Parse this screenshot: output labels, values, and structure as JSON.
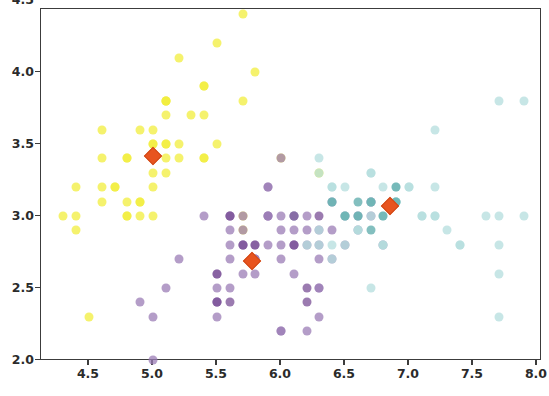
{
  "figure": {
    "title": "",
    "background": "#ffffff",
    "axis_color": "#3c3c3c"
  },
  "axes": {
    "x_ticks": [
      "4.5",
      "5.0",
      "5.5",
      "6.0",
      "6.5",
      "7.0",
      "7.5",
      "8.0"
    ],
    "x_tick_values": [
      4.5,
      5.0,
      5.5,
      6.0,
      6.5,
      7.0,
      7.5,
      8.0
    ],
    "y_ticks": [
      "2.0",
      "2.5",
      "3.0",
      "3.5",
      "4.0",
      "4.5"
    ],
    "y_tick_values": [
      2.0,
      2.5,
      3.0,
      3.5,
      4.0,
      4.5
    ],
    "xlabel": "",
    "ylabel": ""
  },
  "chart_data": {
    "type": "scatter",
    "title": "",
    "xlabel": "",
    "ylabel": "",
    "xlim": [
      4.2,
      8.1
    ],
    "ylim": [
      1.9,
      4.55
    ],
    "grid": false,
    "legend": "none",
    "point_size": 9,
    "point_opacity": 0.75,
    "marker": "circle",
    "centroid_marker": "diamond",
    "centroid_color": "#e8541f",
    "series": [
      {
        "name": "cluster-yellow",
        "color": "#f2ee3c",
        "centroid": [
          5.0,
          3.42
        ],
        "points": [
          [
            5.1,
            3.5
          ],
          [
            4.9,
            3.0
          ],
          [
            4.7,
            3.2
          ],
          [
            4.6,
            3.1
          ],
          [
            5.0,
            3.6
          ],
          [
            5.4,
            3.9
          ],
          [
            4.6,
            3.4
          ],
          [
            5.0,
            3.4
          ],
          [
            4.4,
            2.9
          ],
          [
            4.9,
            3.1
          ],
          [
            5.4,
            3.7
          ],
          [
            4.8,
            3.4
          ],
          [
            4.8,
            3.0
          ],
          [
            4.3,
            3.0
          ],
          [
            5.8,
            4.0
          ],
          [
            5.7,
            4.4
          ],
          [
            5.4,
            3.9
          ],
          [
            5.1,
            3.5
          ],
          [
            5.7,
            3.8
          ],
          [
            5.1,
            3.8
          ],
          [
            5.4,
            3.4
          ],
          [
            5.1,
            3.7
          ],
          [
            4.6,
            3.6
          ],
          [
            5.1,
            3.3
          ],
          [
            4.8,
            3.4
          ],
          [
            5.0,
            3.0
          ],
          [
            5.0,
            3.4
          ],
          [
            5.2,
            3.5
          ],
          [
            5.2,
            3.4
          ],
          [
            4.7,
            3.2
          ],
          [
            4.8,
            3.1
          ],
          [
            5.4,
            3.4
          ],
          [
            5.2,
            4.1
          ],
          [
            5.5,
            4.2
          ],
          [
            4.9,
            3.1
          ],
          [
            5.0,
            3.2
          ],
          [
            5.5,
            3.5
          ],
          [
            4.9,
            3.6
          ],
          [
            4.4,
            3.0
          ],
          [
            5.1,
            3.4
          ],
          [
            5.0,
            3.5
          ],
          [
            4.5,
            2.3
          ],
          [
            4.4,
            3.2
          ],
          [
            5.0,
            3.5
          ],
          [
            5.1,
            3.8
          ],
          [
            4.8,
            3.0
          ],
          [
            5.1,
            3.8
          ],
          [
            4.6,
            3.2
          ],
          [
            5.3,
            3.7
          ],
          [
            5.0,
            3.3
          ],
          [
            5.7,
            3.0
          ],
          [
            6.0,
            3.4
          ],
          [
            5.7,
            2.9
          ],
          [
            6.3,
            3.3
          ]
        ]
      },
      {
        "name": "cluster-purple",
        "color": "#9b7cb5",
        "centroid": [
          5.77,
          2.69
        ],
        "points": [
          [
            5.5,
            2.3
          ],
          [
            6.5,
            2.8
          ],
          [
            5.7,
            2.8
          ],
          [
            4.9,
            2.4
          ],
          [
            6.6,
            2.9
          ],
          [
            5.2,
            2.7
          ],
          [
            5.0,
            2.0
          ],
          [
            5.9,
            3.0
          ],
          [
            6.0,
            2.2
          ],
          [
            6.1,
            2.9
          ],
          [
            5.6,
            2.9
          ],
          [
            6.7,
            3.1
          ],
          [
            5.6,
            3.0
          ],
          [
            5.8,
            2.7
          ],
          [
            6.2,
            2.2
          ],
          [
            5.6,
            2.5
          ],
          [
            5.9,
            3.2
          ],
          [
            6.1,
            2.8
          ],
          [
            6.3,
            2.5
          ],
          [
            6.1,
            2.8
          ],
          [
            6.4,
            2.9
          ],
          [
            6.6,
            3.0
          ],
          [
            6.8,
            2.8
          ],
          [
            6.7,
            3.0
          ],
          [
            6.0,
            2.9
          ],
          [
            5.7,
            2.6
          ],
          [
            5.5,
            2.4
          ],
          [
            5.5,
            2.4
          ],
          [
            5.8,
            2.7
          ],
          [
            6.0,
            2.7
          ],
          [
            5.4,
            3.0
          ],
          [
            6.0,
            3.4
          ],
          [
            6.7,
            3.1
          ],
          [
            6.3,
            2.3
          ],
          [
            5.6,
            3.0
          ],
          [
            5.5,
            2.5
          ],
          [
            5.5,
            2.6
          ],
          [
            6.1,
            3.0
          ],
          [
            5.8,
            2.6
          ],
          [
            5.0,
            2.3
          ],
          [
            5.6,
            2.7
          ],
          [
            5.7,
            3.0
          ],
          [
            5.7,
            2.9
          ],
          [
            6.2,
            2.9
          ],
          [
            5.1,
            2.5
          ],
          [
            5.7,
            2.8
          ],
          [
            5.8,
            2.7
          ],
          [
            6.3,
            2.7
          ],
          [
            6.1,
            3.0
          ],
          [
            5.9,
            3.0
          ],
          [
            6.0,
            2.2
          ],
          [
            6.3,
            2.8
          ],
          [
            6.1,
            2.6
          ],
          [
            6.4,
            3.1
          ],
          [
            6.0,
            3.0
          ],
          [
            5.9,
            3.2
          ],
          [
            6.2,
            2.8
          ],
          [
            5.8,
            2.8
          ],
          [
            6.3,
            2.5
          ],
          [
            5.9,
            2.8
          ],
          [
            6.0,
            2.8
          ],
          [
            6.2,
            3.0
          ],
          [
            5.9,
            3.0
          ],
          [
            5.6,
            2.8
          ],
          [
            6.4,
            2.7
          ],
          [
            6.5,
            3.0
          ],
          [
            6.3,
            2.9
          ]
        ]
      },
      {
        "name": "cluster-cyan",
        "color": "#b4dede",
        "centroid": [
          6.85,
          3.07
        ],
        "points": [
          [
            7.0,
            3.2
          ],
          [
            6.4,
            3.2
          ],
          [
            6.9,
            3.1
          ],
          [
            6.5,
            2.8
          ],
          [
            6.3,
            3.3
          ],
          [
            6.6,
            2.9
          ],
          [
            6.7,
            3.1
          ],
          [
            6.8,
            2.8
          ],
          [
            7.1,
            3.0
          ],
          [
            6.3,
            2.9
          ],
          [
            7.6,
            3.0
          ],
          [
            7.3,
            2.9
          ],
          [
            6.7,
            2.5
          ],
          [
            7.2,
            3.6
          ],
          [
            6.5,
            3.2
          ],
          [
            6.4,
            2.7
          ],
          [
            6.8,
            3.0
          ],
          [
            7.7,
            3.8
          ],
          [
            7.7,
            2.6
          ],
          [
            7.7,
            2.8
          ],
          [
            6.9,
            3.2
          ],
          [
            7.7,
            3.0
          ],
          [
            6.7,
            3.3
          ],
          [
            7.2,
            3.2
          ],
          [
            6.2,
            2.8
          ],
          [
            6.1,
            3.0
          ],
          [
            7.2,
            3.0
          ],
          [
            7.4,
            2.8
          ],
          [
            7.9,
            3.8
          ],
          [
            6.4,
            2.8
          ],
          [
            6.3,
            2.8
          ],
          [
            6.9,
            3.1
          ],
          [
            6.7,
            3.1
          ],
          [
            6.9,
            3.1
          ],
          [
            6.8,
            3.2
          ],
          [
            6.7,
            3.3
          ],
          [
            6.7,
            3.0
          ],
          [
            6.5,
            3.0
          ],
          [
            7.9,
            3.0
          ],
          [
            7.7,
            2.3
          ],
          [
            7.0,
            3.2
          ],
          [
            6.6,
            3.0
          ],
          [
            6.8,
            2.8
          ],
          [
            7.1,
            3.0
          ],
          [
            6.6,
            2.9
          ],
          [
            6.4,
            3.2
          ],
          [
            6.3,
            3.4
          ],
          [
            6.5,
            3.0
          ],
          [
            6.4,
            3.1
          ],
          [
            6.9,
            3.1
          ],
          [
            7.4,
            2.8
          ],
          [
            7.2,
            3.0
          ]
        ]
      },
      {
        "name": "cluster-teal-dark",
        "color": "#5aa9a9",
        "centroid": null,
        "points": [
          [
            6.6,
            3.0
          ],
          [
            6.7,
            3.1
          ],
          [
            6.9,
            3.1
          ],
          [
            6.8,
            3.0
          ],
          [
            6.5,
            3.0
          ],
          [
            6.7,
            2.9
          ],
          [
            6.4,
            3.1
          ],
          [
            6.9,
            3.2
          ],
          [
            6.6,
            3.1
          ]
        ]
      },
      {
        "name": "cluster-purple-dark",
        "color": "#7a4f96",
        "centroid": null,
        "points": [
          [
            5.6,
            3.0
          ],
          [
            5.8,
            2.8
          ],
          [
            5.5,
            2.4
          ],
          [
            6.1,
            3.0
          ],
          [
            6.3,
            3.0
          ],
          [
            5.7,
            2.8
          ],
          [
            6.1,
            2.8
          ],
          [
            5.5,
            2.6
          ],
          [
            6.2,
            2.4
          ],
          [
            6.2,
            2.5
          ],
          [
            5.6,
            2.4
          ]
        ]
      }
    ],
    "centroids": [
      {
        "label": "centroid-yellow-cluster",
        "x": 5.0,
        "y": 3.42
      },
      {
        "label": "centroid-purple-cluster",
        "x": 5.77,
        "y": 2.69
      },
      {
        "label": "centroid-cyan-cluster",
        "x": 6.85,
        "y": 3.07
      }
    ]
  }
}
